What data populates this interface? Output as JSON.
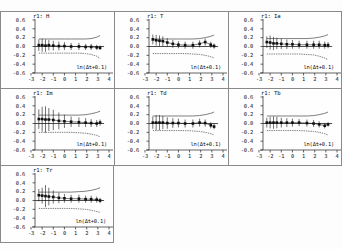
{
  "figure": {
    "panel_count": 7,
    "layout": "3 columns x 3 rows, last row single panel",
    "background_color": "#fdfdfd",
    "frame_color": "#8a8a8a",
    "point_color": "#111111",
    "band_color": "#444444",
    "zero_line_color": "#222222"
  },
  "axes": {
    "xlabel": "ln(Δt+0.1)",
    "xticks": [
      "-3",
      "-2",
      "-1",
      "0",
      "1",
      "2",
      "3",
      "4"
    ],
    "xtick_values": [
      -3,
      -2,
      -1,
      0,
      1,
      2,
      3,
      4
    ],
    "yticks": [
      "0.6",
      "0.4",
      "0.2",
      "0.0",
      "-0.2",
      "-0.4",
      "-0.6"
    ],
    "ytick_values": [
      0.6,
      0.4,
      0.2,
      0.0,
      -0.2,
      -0.4,
      -0.6
    ],
    "xlim": [
      -3,
      4
    ],
    "ylim": [
      -0.6,
      0.6
    ],
    "grid": false,
    "legend": "none"
  },
  "chart_data": [
    {
      "type": "scatter",
      "title": "r1: H",
      "xlabel": "ln(Δt+0.1)",
      "ylabel": "",
      "xlim": [
        -3,
        4
      ],
      "ylim": [
        -0.6,
        0.6
      ],
      "grid": false,
      "x": [
        -2.3,
        -2.0,
        -1.7,
        -1.4,
        -1.0,
        -0.5,
        0.0,
        0.6,
        1.3,
        1.9,
        2.4,
        2.9,
        3.2
      ],
      "values": [
        0.03,
        0.03,
        0.02,
        0.03,
        0.02,
        0.01,
        0.01,
        0.0,
        0.0,
        -0.01,
        -0.01,
        -0.02,
        -0.03
      ],
      "yerr": [
        0.13,
        0.15,
        0.14,
        0.12,
        0.11,
        0.1,
        0.09,
        0.08,
        0.08,
        0.07,
        0.07,
        0.06,
        0.05
      ],
      "upper_band": [
        0.17,
        0.17,
        0.17,
        0.17,
        0.17,
        0.17,
        0.17,
        0.17,
        0.17,
        0.17,
        0.18,
        0.21,
        0.25
      ],
      "lower_band": [
        -0.15,
        -0.15,
        -0.15,
        -0.15,
        -0.15,
        -0.15,
        -0.15,
        -0.15,
        -0.15,
        -0.16,
        -0.18,
        -0.22,
        -0.27
      ],
      "zero_line": 0.0
    },
    {
      "type": "scatter",
      "title": "r1: T",
      "xlabel": "ln(Δt+0.1)",
      "ylabel": "",
      "xlim": [
        -3,
        4
      ],
      "ylim": [
        -0.6,
        0.6
      ],
      "grid": false,
      "x": [
        -2.3,
        -2.0,
        -1.7,
        -1.4,
        -1.0,
        -0.5,
        0.0,
        0.6,
        1.3,
        1.9,
        2.4,
        2.9,
        3.2
      ],
      "values": [
        0.16,
        0.14,
        0.13,
        0.12,
        0.09,
        0.06,
        0.04,
        0.03,
        0.03,
        0.06,
        0.1,
        0.04,
        0.01
      ],
      "yerr": [
        0.11,
        0.12,
        0.12,
        0.11,
        0.1,
        0.09,
        0.08,
        0.08,
        0.08,
        0.08,
        0.08,
        0.07,
        0.06
      ],
      "upper_band": [
        0.17,
        0.17,
        0.17,
        0.17,
        0.17,
        0.17,
        0.17,
        0.17,
        0.17,
        0.18,
        0.2,
        0.23,
        0.26
      ],
      "lower_band": [
        -0.16,
        -0.16,
        -0.16,
        -0.16,
        -0.16,
        -0.16,
        -0.16,
        -0.16,
        -0.17,
        -0.18,
        -0.2,
        -0.23,
        -0.26
      ],
      "zero_line": 0.0
    },
    {
      "type": "scatter",
      "title": "r1: Ia",
      "xlabel": "ln(Δt+0.1)",
      "ylabel": "",
      "xlim": [
        -3,
        4
      ],
      "ylim": [
        -0.6,
        0.6
      ],
      "grid": false,
      "x": [
        -2.3,
        -2.0,
        -1.7,
        -1.4,
        -1.0,
        -0.5,
        0.0,
        0.6,
        1.3,
        1.9,
        2.4,
        2.9,
        3.2
      ],
      "values": [
        0.1,
        0.09,
        0.07,
        0.07,
        0.06,
        0.05,
        0.05,
        0.04,
        0.04,
        0.04,
        0.04,
        0.03,
        0.03
      ],
      "yerr": [
        0.13,
        0.16,
        0.15,
        0.13,
        0.12,
        0.11,
        0.1,
        0.09,
        0.09,
        0.09,
        0.09,
        0.08,
        0.07
      ],
      "upper_band": [
        0.18,
        0.18,
        0.18,
        0.18,
        0.18,
        0.18,
        0.18,
        0.18,
        0.18,
        0.19,
        0.21,
        0.24,
        0.27
      ],
      "lower_band": [
        -0.17,
        -0.17,
        -0.17,
        -0.17,
        -0.17,
        -0.17,
        -0.17,
        -0.17,
        -0.18,
        -0.19,
        -0.22,
        -0.26,
        -0.3
      ],
      "zero_line": 0.0
    },
    {
      "type": "scatter",
      "title": "r1: Im",
      "xlabel": "ln(Δt+0.1)",
      "ylabel": "",
      "xlim": [
        -3,
        4
      ],
      "ylim": [
        -0.6,
        0.6
      ],
      "grid": false,
      "x": [
        -2.3,
        -2.0,
        -1.7,
        -1.4,
        -1.0,
        -0.5,
        0.0,
        0.6,
        1.3,
        1.9,
        2.4,
        2.9,
        3.2
      ],
      "values": [
        0.1,
        0.1,
        0.09,
        0.09,
        0.08,
        0.06,
        0.05,
        0.04,
        0.03,
        0.02,
        0.01,
        0.0,
        0.02
      ],
      "yerr": [
        0.22,
        0.28,
        0.3,
        0.26,
        0.23,
        0.19,
        0.15,
        0.12,
        0.11,
        0.1,
        0.09,
        0.08,
        0.07
      ],
      "upper_band": [
        0.19,
        0.19,
        0.19,
        0.19,
        0.19,
        0.19,
        0.19,
        0.19,
        0.19,
        0.2,
        0.22,
        0.25,
        0.28
      ],
      "lower_band": [
        -0.2,
        -0.2,
        -0.2,
        -0.2,
        -0.2,
        -0.2,
        -0.2,
        -0.2,
        -0.21,
        -0.22,
        -0.24,
        -0.27,
        -0.3
      ],
      "zero_line": 0.0
    },
    {
      "type": "scatter",
      "title": "r1: Td",
      "xlabel": "ln(Δt+0.1)",
      "ylabel": "",
      "xlim": [
        -3,
        4
      ],
      "ylim": [
        -0.6,
        0.6
      ],
      "grid": false,
      "x": [
        -2.3,
        -2.0,
        -1.7,
        -1.4,
        -1.0,
        -0.5,
        0.0,
        0.6,
        1.3,
        1.9,
        2.4,
        2.9,
        3.2
      ],
      "values": [
        0.02,
        0.02,
        0.02,
        0.02,
        0.01,
        0.01,
        0.01,
        0.0,
        0.0,
        0.02,
        0.01,
        -0.04,
        -0.07
      ],
      "yerr": [
        0.14,
        0.17,
        0.17,
        0.15,
        0.13,
        0.11,
        0.1,
        0.09,
        0.09,
        0.09,
        0.08,
        0.07,
        0.06
      ],
      "upper_band": [
        0.17,
        0.17,
        0.17,
        0.17,
        0.17,
        0.17,
        0.17,
        0.17,
        0.17,
        0.18,
        0.2,
        0.23,
        0.26
      ],
      "lower_band": [
        -0.16,
        -0.16,
        -0.16,
        -0.16,
        -0.16,
        -0.16,
        -0.16,
        -0.16,
        -0.17,
        -0.18,
        -0.2,
        -0.23,
        -0.26
      ],
      "zero_line": 0.0
    },
    {
      "type": "scatter",
      "title": "r1: Tb",
      "xlabel": "ln(Δt+0.1)",
      "ylabel": "",
      "xlim": [
        -3,
        4
      ],
      "ylim": [
        -0.6,
        0.6
      ],
      "grid": false,
      "x": [
        -2.3,
        -2.0,
        -1.7,
        -1.4,
        -1.0,
        -0.5,
        0.0,
        0.6,
        1.3,
        1.9,
        2.4,
        2.9,
        3.2
      ],
      "values": [
        0.02,
        0.02,
        0.02,
        0.02,
        0.02,
        0.02,
        0.02,
        0.02,
        0.01,
        0.0,
        -0.02,
        -0.05,
        -0.02
      ],
      "yerr": [
        0.11,
        0.13,
        0.14,
        0.13,
        0.11,
        0.1,
        0.09,
        0.08,
        0.08,
        0.08,
        0.07,
        0.06,
        0.05
      ],
      "upper_band": [
        0.17,
        0.17,
        0.17,
        0.17,
        0.17,
        0.17,
        0.17,
        0.17,
        0.17,
        0.18,
        0.2,
        0.23,
        0.26
      ],
      "lower_band": [
        -0.16,
        -0.16,
        -0.16,
        -0.16,
        -0.16,
        -0.16,
        -0.16,
        -0.16,
        -0.17,
        -0.18,
        -0.2,
        -0.23,
        -0.26
      ],
      "zero_line": 0.0
    },
    {
      "type": "scatter",
      "title": "r1: Tr",
      "xlabel": "ln(Δt+0.1)",
      "ylabel": "",
      "xlim": [
        -3,
        4
      ],
      "ylim": [
        -0.6,
        0.6
      ],
      "grid": false,
      "x": [
        -2.3,
        -2.0,
        -1.7,
        -1.4,
        -1.0,
        -0.5,
        0.0,
        0.6,
        1.3,
        1.9,
        2.4,
        2.9,
        3.2
      ],
      "values": [
        0.12,
        0.11,
        0.1,
        0.09,
        0.08,
        0.06,
        0.05,
        0.04,
        0.04,
        0.03,
        0.03,
        0.02,
        0.0
      ],
      "yerr": [
        0.14,
        0.18,
        0.25,
        0.2,
        0.15,
        0.12,
        0.1,
        0.09,
        0.09,
        0.08,
        0.08,
        0.07,
        0.06
      ],
      "upper_band": [
        0.19,
        0.19,
        0.19,
        0.19,
        0.19,
        0.19,
        0.19,
        0.19,
        0.2,
        0.21,
        0.23,
        0.26,
        0.29
      ],
      "lower_band": [
        -0.18,
        -0.18,
        -0.18,
        -0.18,
        -0.18,
        -0.18,
        -0.18,
        -0.18,
        -0.19,
        -0.2,
        -0.22,
        -0.25,
        -0.27
      ],
      "zero_line": 0.0
    }
  ]
}
